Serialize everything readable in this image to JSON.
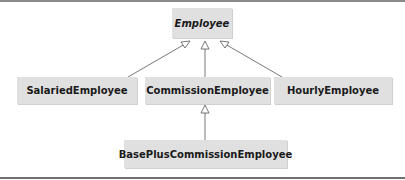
{
  "diagram": {
    "type": "UML class hierarchy",
    "classes": [
      {
        "id": "employee",
        "name": "Employee",
        "abstract": true
      },
      {
        "id": "salaried",
        "name": "SalariedEmployee",
        "abstract": false
      },
      {
        "id": "commission",
        "name": "CommissionEmployee",
        "abstract": false
      },
      {
        "id": "hourly",
        "name": "HourlyEmployee",
        "abstract": false
      },
      {
        "id": "baseplus",
        "name": "BasePlusCommissionEmployee",
        "abstract": false
      }
    ],
    "generalizations": [
      {
        "from": "SalariedEmployee",
        "to": "Employee"
      },
      {
        "from": "CommissionEmployee",
        "to": "Employee"
      },
      {
        "from": "HourlyEmployee",
        "to": "Employee"
      },
      {
        "from": "BasePlusCommissionEmployee",
        "to": "CommissionEmployee"
      }
    ],
    "colors": {
      "box_fill": "#e0e0e0",
      "line": "#555555",
      "rule": "#8a8a8a"
    }
  }
}
